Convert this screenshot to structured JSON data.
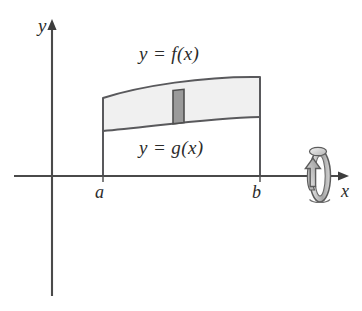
{
  "figure": {
    "background_color": "#ffffff",
    "axes": {
      "y_axis_label": "y",
      "x_axis_label": "x",
      "origin": {
        "x": 52,
        "y": 176
      },
      "x_axis_end": {
        "x": 348,
        "y": 176
      },
      "y_axis_top": {
        "y": 22
      },
      "y_axis_bottom": {
        "y": 296
      },
      "axis_color": "#4a4a4a"
    },
    "tick_labels": {
      "left_bound": "a",
      "right_bound": "b",
      "left_bound_x": 103,
      "right_bound_x": 260
    },
    "curve_labels": {
      "upper": "y = f(x)",
      "lower": "y = g(x)"
    },
    "region": {
      "fill_color": "#f0f0f0",
      "edge_color": "#59595c",
      "upper_curve_left_y": 98,
      "upper_curve_right_y": 77,
      "lower_curve_left_y": 131,
      "lower_curve_right_y": 117
    },
    "representative_strip": {
      "fill_color": "#9a9a9a",
      "edge_color": "#4f4f4f",
      "x_left": 173,
      "x_right": 184
    },
    "revolution_symbol": {
      "name": "rotation about x-axis",
      "center_x": 318,
      "center_y": 176,
      "body_color": "#bdbdbd",
      "edge_color": "#5c5c5c"
    }
  }
}
